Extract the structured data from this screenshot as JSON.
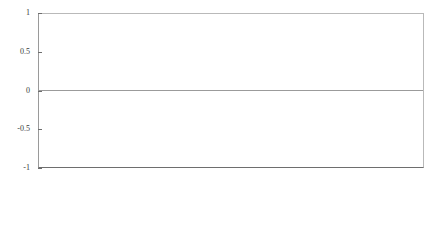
{
  "chart_data": {
    "type": "line",
    "title": "",
    "subtitle": "",
    "xlabel": "",
    "ylabel": "",
    "ylim": [
      -1,
      1
    ],
    "yticks": [
      1,
      0.5,
      0,
      -0.5,
      -1
    ],
    "ytick_labels": [
      "1",
      "0.5",
      "0",
      "-0.5",
      "-1"
    ],
    "grid": false,
    "legend": "none",
    "zero_line": true,
    "line_color": "#4a4a4a",
    "line_width": 0.5,
    "axis_color": "#6e6e6e",
    "background": "#ffffff",
    "x_tick_labels": [
      "January 99",
      "April 99",
      "July 99",
      "October 99",
      "January 00",
      "April 00",
      "July 00",
      "October 00",
      "January 01",
      "April 01",
      "July 01",
      "October 01",
      "January 02",
      "April 02",
      "July 02",
      "October 02",
      "January 03",
      "April 03",
      "July 03",
      "October 03",
      "January 04",
      "April 04",
      "July 04",
      "October 04",
      "January 05",
      "April 05",
      "July 05",
      "October 05"
    ],
    "x_tick_count": 28,
    "x_start": "January 99",
    "x_end": "October 05",
    "sampling": "high-frequency observations between quarterly ticks",
    "series": [
      {
        "name": "series-1",
        "values": [
          0.08,
          0.02,
          0.17,
          -0.03,
          0.06,
          0.21,
          -0.08,
          0.04,
          0.12,
          -0.02,
          0.19,
          0.05,
          -0.11,
          0.09,
          0.25,
          -0.05,
          0.03,
          0.14,
          -0.04,
          0.07,
          0.11,
          -0.72,
          0.06,
          0.16,
          0.02,
          -0.09,
          0.21,
          0.04,
          -0.03,
          0.13,
          0.08,
          -0.06,
          0.18,
          0.02,
          0.35,
          -0.04,
          0.09,
          -0.55,
          0.05,
          0.12,
          -0.02,
          0.16,
          0.07,
          -0.1,
          0.22,
          0.03,
          -0.05,
          0.11,
          0.44,
          -0.03,
          0.08,
          0.14,
          -0.62,
          0.05,
          0.17,
          0.02,
          -0.07,
          0.12,
          0.06,
          -0.04,
          0.19,
          0.03,
          0.09,
          -0.08,
          0.15,
          0.04,
          -0.03,
          0.11,
          0.07,
          -0.51,
          0.05,
          0.13,
          0.02,
          -0.06,
          0.18,
          0.08,
          -0.04,
          0.1,
          0.03,
          0.22,
          -0.07,
          0.06,
          0.14,
          -0.03,
          0.09,
          0.17,
          -0.05,
          0.04,
          0.12,
          -0.68,
          0.07,
          0.15,
          0.02,
          -0.09,
          0.2,
          0.05,
          -0.03,
          0.11,
          0.08,
          0.28,
          -0.06,
          0.04,
          0.16,
          -0.88,
          0.09,
          0.03,
          0.13,
          -0.05,
          0.07,
          0.19,
          0.02,
          -0.04,
          0.1,
          0.24,
          -0.07,
          0.06,
          0.14,
          0.03,
          -0.52,
          0.08,
          0.17,
          -0.03,
          0.05,
          0.3,
          0.09,
          -0.06,
          0.12,
          0.04,
          0.18,
          -0.04,
          0.07,
          0.21,
          0.03,
          -0.08,
          0.13,
          0.42,
          -0.05,
          0.09,
          0.16,
          0.02,
          -0.06,
          0.11,
          0.26,
          0.05,
          -0.03,
          0.15,
          0.08,
          -0.7,
          0.04,
          0.19,
          0.03,
          0.12,
          -0.05,
          0.07,
          0.33,
          -0.04,
          0.1,
          0.17,
          0.02,
          -0.09,
          0.14,
          0.06,
          0.23,
          -0.03,
          0.08,
          0.38,
          -0.06,
          0.05,
          0.13,
          0.2,
          -0.04,
          0.09,
          0.16,
          0.03,
          -0.07,
          0.11,
          0.29,
          0.06,
          -0.48,
          0.12,
          0.18,
          0.04,
          -0.05,
          0.22,
          0.08,
          0.15,
          -0.03,
          0.1,
          0.47,
          -0.06,
          0.05,
          0.14,
          0.25,
          -0.04,
          0.09,
          0.19,
          0.03,
          -0.58,
          0.11,
          0.31,
          0.07,
          -0.05,
          0.16,
          0.12,
          0.98,
          -0.03,
          0.08,
          0.21,
          -0.07,
          0.05,
          0.13,
          0.27,
          0.04,
          -0.09,
          0.17,
          0.62,
          0.06,
          -0.04,
          0.11,
          0.24,
          0.03,
          -0.06,
          0.15,
          0.09,
          0.99,
          -0.05,
          0.07,
          0.18,
          -0.64,
          0.12,
          0.04,
          0.22,
          0.08,
          -0.03,
          0.14,
          0.16,
          -0.08,
          0.06,
          0.33,
          0.1,
          -0.05,
          0.13,
          0.19,
          0.03,
          -0.07,
          0.09,
          0.99,
          0.05,
          -0.44,
          0.15,
          0.08,
          0.26,
          -0.04,
          0.11,
          0.17,
          0.02,
          -0.06,
          0.12,
          0.36,
          0.07,
          -0.03,
          0.14,
          0.21,
          -0.09,
          0.05,
          0.1,
          0.18,
          0.04,
          -0.05,
          0.13,
          0.29,
          0.08,
          -0.75,
          0.06,
          0.16,
          0.03,
          0.23,
          -0.04,
          0.11,
          0.19,
          0.07,
          -0.06,
          0.14,
          0.09,
          0.41,
          0.02,
          -0.03,
          0.12,
          0.17,
          -0.08,
          0.05,
          0.15,
          0.1,
          0.24,
          -0.04,
          0.08,
          0.13,
          0.03,
          -0.56,
          0.18,
          0.06,
          0.11,
          0.32,
          -0.05,
          0.09,
          0.16,
          0.04,
          -0.07,
          0.12,
          0.2,
          0.07,
          -0.03,
          0.14,
          0.08,
          0.88,
          0.05,
          -0.39,
          0.1,
          0.17,
          0.03,
          -0.06,
          0.13,
          0.22,
          0.09,
          -0.04,
          0.15,
          0.11,
          0.27,
          0.06,
          -0.08,
          0.12,
          0.18,
          0.04,
          -0.05,
          0.1,
          0.35,
          0.07,
          0.14,
          -0.03,
          0.09,
          0.21,
          -0.66,
          0.05,
          0.16,
          0.08,
          0.12,
          -0.04,
          0.19,
          0.06,
          0.25,
          0.03,
          -0.07,
          0.13,
          0.1,
          0.17,
          -0.05,
          0.08,
          0.3,
          0.04,
          0.11,
          -0.03,
          0.15,
          0.09,
          0.95,
          0.06,
          -0.42,
          0.12,
          0.18,
          0.05,
          -0.06,
          0.1,
          0.23,
          0.07,
          0.14,
          -0.04,
          0.09,
          0.16,
          0.03,
          -0.08,
          0.11,
          0.28,
          0.06,
          0.13,
          -0.05,
          0.08,
          0.2,
          0.04,
          -0.03,
          0.15,
          0.1,
          0.46,
          0.07,
          -0.61,
          0.12,
          0.17,
          0.05,
          0.09,
          -0.04,
          0.14,
          0.08,
          0.22,
          0.03,
          -0.06,
          0.11,
          0.16,
          0.06,
          -0.03,
          0.13,
          0.09,
          0.26,
          0.05,
          -0.07,
          0.1,
          0.18,
          0.04,
          0.12,
          -0.05,
          0.08,
          0.15,
          0.03,
          -0.34,
          0.09,
          0.21,
          0.06,
          0.11,
          -0.04,
          0.14,
          0.07,
          0.17,
          0.02,
          -0.06,
          0.1,
          0.13,
          0.05,
          0.24,
          -0.03,
          0.08,
          0.16,
          0.04,
          -0.09,
          0.11,
          0.19,
          0.06,
          0.12,
          -0.05,
          0.09,
          0.14,
          0.03,
          0.2,
          -0.04,
          0.07,
          0.1,
          0.15,
          0.05,
          -0.06,
          0.12,
          0.08,
          0.17,
          0.03,
          -0.03,
          0.09,
          0.13,
          0.06,
          0.11,
          -0.05,
          0.07,
          0.16,
          0.04,
          0.1,
          -0.04,
          0.08,
          0.12,
          0.05,
          0.14,
          -0.03,
          0.09,
          0.11,
          0.06,
          0.08,
          0.03
        ]
      }
    ]
  }
}
